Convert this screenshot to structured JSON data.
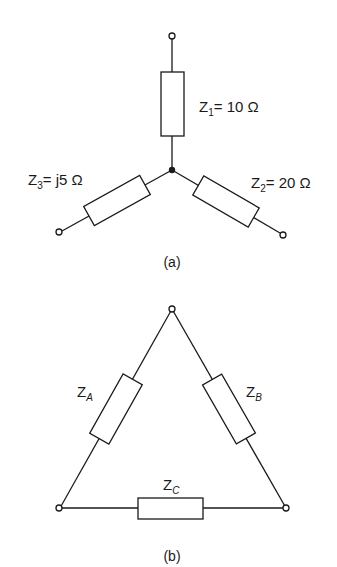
{
  "figure_a": {
    "caption": "(a)",
    "type": "star (Y) network",
    "impedances": [
      {
        "name": "Z",
        "sub": "1",
        "eq": "= 10  Ω"
      },
      {
        "name": "Z",
        "sub": "2",
        "eq": "= 20 Ω"
      },
      {
        "name": "Z",
        "sub": "3",
        "eq": "= j5 Ω"
      }
    ]
  },
  "figure_b": {
    "caption": "(b)",
    "type": "delta (Δ) network",
    "impedances": [
      {
        "name": "Z",
        "sub": "A"
      },
      {
        "name": "Z",
        "sub": "B"
      },
      {
        "name": "Z",
        "sub": "C"
      }
    ]
  },
  "colors": {
    "line": "#1a1a1a",
    "background": "#ffffff"
  }
}
